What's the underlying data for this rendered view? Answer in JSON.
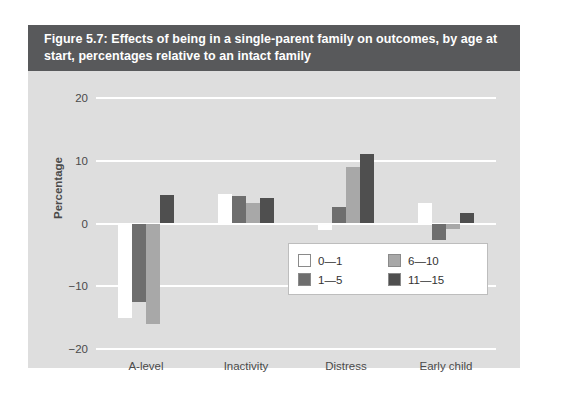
{
  "figure": {
    "title": "Figure 5.7: Effects of being in a single-parent family on outcomes, by age at start, percentages relative to an intact family",
    "panel_bg": "#dedede",
    "title_bg": "#58595b"
  },
  "chart_data": {
    "type": "bar",
    "title": "Figure 5.7: Effects of being in a single-parent family on outcomes, by age at start, percentages relative to an intact family",
    "xlabel": "",
    "ylabel": "Percentage",
    "categories": [
      "A-level",
      "Inactivity",
      "Distress",
      "Early child"
    ],
    "ylim": [
      -20,
      20
    ],
    "yticks": [
      20,
      10,
      0,
      -10,
      -20
    ],
    "ytick_labels": [
      "20",
      "10",
      "0",
      "−10",
      "−20"
    ],
    "grid": true,
    "legend_position": "inside-right",
    "series": [
      {
        "name": "0—1",
        "color": "#ffffff",
        "values": [
          -15.0,
          4.7,
          -1.0,
          3.2
        ]
      },
      {
        "name": "1—5",
        "color": "#6e6e6e",
        "values": [
          -12.5,
          4.4,
          2.6,
          -2.6
        ]
      },
      {
        "name": "6—10",
        "color": "#a8a8a8",
        "values": [
          -16.0,
          3.3,
          9.0,
          -0.8
        ]
      },
      {
        "name": "11—15",
        "color": "#4f4f4f",
        "values": [
          4.6,
          4.1,
          11.0,
          1.6
        ]
      }
    ]
  }
}
